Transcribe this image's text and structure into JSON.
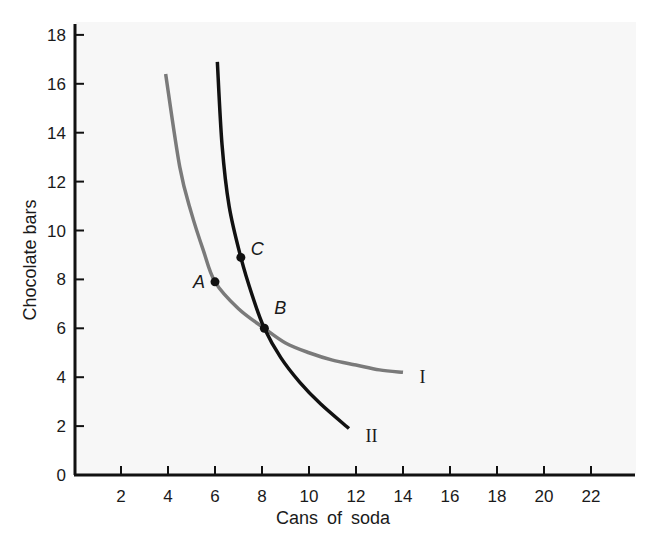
{
  "chart_data": {
    "type": "line",
    "title": "",
    "xlabel": "Cans of soda",
    "ylabel": "Chocolate bars",
    "xlim": [
      0,
      24
    ],
    "ylim": [
      0,
      18
    ],
    "x_ticks": [
      2,
      4,
      6,
      8,
      10,
      12,
      14,
      16,
      18,
      20,
      22
    ],
    "y_ticks": [
      0,
      2,
      4,
      6,
      8,
      10,
      12,
      14,
      16,
      18
    ],
    "grid": false,
    "legend": "none (curves labeled inline)",
    "series": [
      {
        "name": "I",
        "color": "#7a7a7a",
        "points": [
          [
            3.9,
            16.4
          ],
          [
            4.5,
            12.6
          ],
          [
            5.0,
            10.7
          ],
          [
            5.5,
            9.2
          ],
          [
            6.0,
            7.9
          ],
          [
            7.0,
            6.8
          ],
          [
            8.1,
            6.0
          ],
          [
            9.0,
            5.4
          ],
          [
            10.0,
            5.0
          ],
          [
            11.0,
            4.7
          ],
          [
            12.0,
            4.5
          ],
          [
            13.0,
            4.3
          ],
          [
            14.0,
            4.2
          ]
        ]
      },
      {
        "name": "II",
        "color": "#111111",
        "points": [
          [
            6.1,
            16.9
          ],
          [
            6.3,
            13.5
          ],
          [
            6.6,
            11.0
          ],
          [
            7.1,
            8.9
          ],
          [
            7.6,
            7.3
          ],
          [
            8.1,
            6.0
          ],
          [
            8.8,
            4.8
          ],
          [
            9.6,
            3.8
          ],
          [
            10.5,
            2.9
          ],
          [
            11.7,
            1.9
          ]
        ]
      }
    ],
    "annotations": [
      {
        "label": "A",
        "x": 6.0,
        "y": 7.9,
        "on": "I"
      },
      {
        "label": "B",
        "x": 8.1,
        "y": 6.0,
        "on": "I and II"
      },
      {
        "label": "C",
        "x": 7.1,
        "y": 8.9,
        "on": "II"
      }
    ],
    "curve_labels": [
      {
        "label": "I",
        "x": 14.7,
        "y": 4.0
      },
      {
        "label": "II",
        "x": 12.4,
        "y": 1.6
      }
    ]
  },
  "layout": {
    "plot_left": 74,
    "plot_bottom": 475,
    "plot_right": 635,
    "plot_top": 20,
    "px_per_x": 23.5,
    "px_per_y": 24.45
  }
}
